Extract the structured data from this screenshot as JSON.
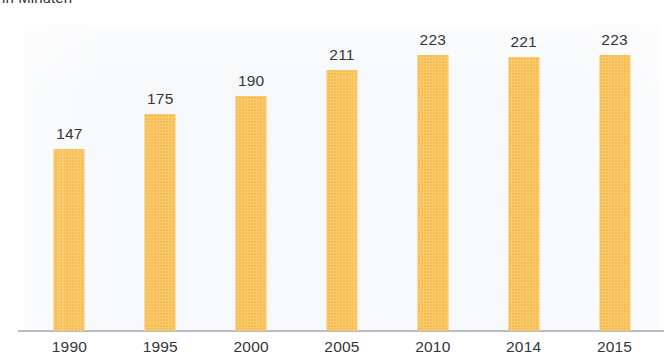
{
  "chart_data": {
    "type": "bar",
    "title": "in Minuten",
    "subtitle": "",
    "xlabel": "",
    "ylabel": "",
    "categories": [
      "1990",
      "1995",
      "2000",
      "2005",
      "2010",
      "2014",
      "2015"
    ],
    "values": [
      147,
      175,
      190,
      211,
      223,
      221,
      223
    ],
    "data_labels": [
      "147",
      "175",
      "190",
      "211",
      "223",
      "221",
      "223"
    ],
    "series": [
      {
        "name": "in Minuten",
        "values": [
          147,
          175,
          190,
          211,
          223,
          221,
          223
        ]
      }
    ],
    "ylim": [
      0,
      247
    ],
    "grid": false,
    "legend": false,
    "legend_position": "none",
    "bar_color": "#f7be4f",
    "label_color": "#363638",
    "axis_color": "#b9bdc2",
    "panel_color": "#f6f8fa",
    "background_color": "#ffffff"
  },
  "axis": {
    "baseline_name": "x-axis-baseline"
  }
}
